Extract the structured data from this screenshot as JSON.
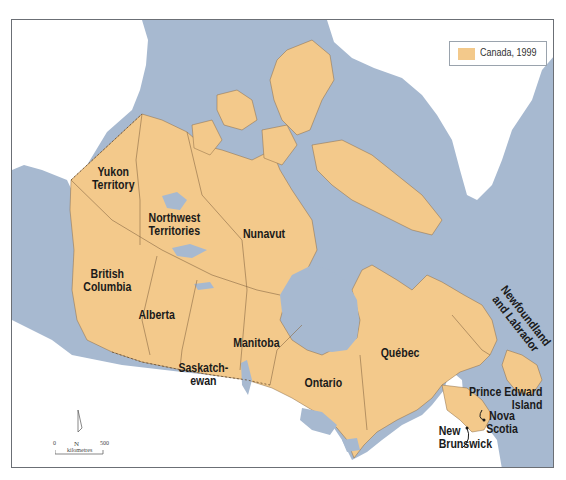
{
  "map": {
    "title": "Canada, 1999",
    "colors": {
      "water": "#a7b9d0",
      "canada_land": "#f3c98b",
      "other_land": "#ffffff",
      "border_line": "#8a6a45",
      "frame": "#6b6f75"
    },
    "legend": {
      "entries": [
        {
          "label": "Canada, 1999",
          "swatch_color": "#f3c98b"
        }
      ]
    },
    "regions": [
      {
        "id": "yukon",
        "label_lines": [
          "Yukon",
          "Territory"
        ]
      },
      {
        "id": "northwest-territories",
        "label_lines": [
          "Northwest",
          "Territories"
        ]
      },
      {
        "id": "nunavut",
        "label_lines": [
          "Nunavut"
        ]
      },
      {
        "id": "british-columbia",
        "label_lines": [
          "British",
          "Columbia"
        ]
      },
      {
        "id": "alberta",
        "label_lines": [
          "Alberta"
        ]
      },
      {
        "id": "saskatchewan",
        "label_lines": [
          "Saskatch-",
          "ewan"
        ]
      },
      {
        "id": "manitoba",
        "label_lines": [
          "Manitoba"
        ]
      },
      {
        "id": "ontario",
        "label_lines": [
          "Ontario"
        ]
      },
      {
        "id": "quebec",
        "label_lines": [
          "Québec"
        ]
      },
      {
        "id": "newfoundland-and-labrador",
        "label_lines": [
          "Newfoundland",
          "and Labrador"
        ]
      },
      {
        "id": "prince-edward-island",
        "label_lines": [
          "Prince Edward",
          "Island"
        ]
      },
      {
        "id": "nova-scotia",
        "label_lines": [
          "Nova",
          "Scotia"
        ]
      },
      {
        "id": "new-brunswick",
        "label_lines": [
          "New",
          "Brunswick"
        ]
      }
    ],
    "north_arrow": {
      "label": "N"
    },
    "scale_bar": {
      "start": "0",
      "end": "500",
      "unit": "kilometres"
    }
  }
}
